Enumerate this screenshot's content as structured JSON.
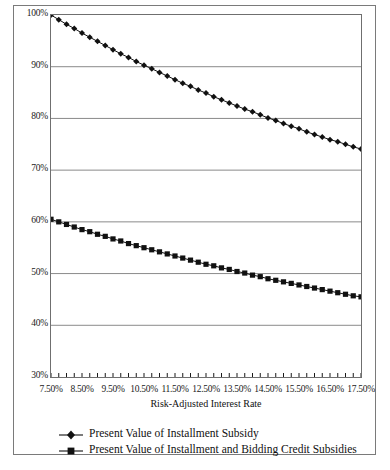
{
  "chart_data": {
    "type": "line",
    "title": "",
    "xlabel": "Risk-Adjusted Interest Rate",
    "ylabel": "",
    "xlim": [
      7.5,
      17.5
    ],
    "ylim": [
      30,
      100
    ],
    "grid": true,
    "grid_axis": "y",
    "legend_position": "bottom-left",
    "x_tick_labels": [
      "7.50%",
      "8.50%",
      "9.50%",
      "10.50%",
      "11.50%",
      "12.50%",
      "13.50%",
      "14.50%",
      "15.50%",
      "16.50%",
      "17.50%"
    ],
    "x_tick_values": [
      7.5,
      8.5,
      9.5,
      10.5,
      11.5,
      12.5,
      13.5,
      14.5,
      15.5,
      16.5,
      17.5
    ],
    "x_minor_tick_step": 0.25,
    "y_tick_labels": [
      "30%",
      "40%",
      "50%",
      "60%",
      "70%",
      "80%",
      "90%",
      "100%"
    ],
    "y_tick_values": [
      30,
      40,
      50,
      60,
      70,
      80,
      90,
      100
    ],
    "x": [
      7.5,
      7.75,
      8.0,
      8.25,
      8.5,
      8.75,
      9.0,
      9.25,
      9.5,
      9.75,
      10.0,
      10.25,
      10.5,
      10.75,
      11.0,
      11.25,
      11.5,
      11.75,
      12.0,
      12.25,
      12.5,
      12.75,
      13.0,
      13.25,
      13.5,
      13.75,
      14.0,
      14.25,
      14.5,
      14.75,
      15.0,
      15.25,
      15.5,
      15.75,
      16.0,
      16.25,
      16.5,
      16.75,
      17.0,
      17.25,
      17.5
    ],
    "series": [
      {
        "name": "Present Value of Installment Subsidy",
        "marker": "diamond",
        "color": "#111111",
        "values": [
          100.0,
          99.1,
          98.2,
          97.4,
          96.5,
          95.7,
          94.9,
          94.1,
          93.3,
          92.5,
          91.8,
          91.0,
          90.3,
          89.6,
          88.9,
          88.2,
          87.5,
          86.8,
          86.2,
          85.5,
          84.9,
          84.2,
          83.6,
          83.0,
          82.4,
          81.8,
          81.3,
          80.7,
          80.1,
          79.6,
          79.0,
          78.5,
          78.0,
          77.4,
          76.9,
          76.4,
          75.9,
          75.5,
          75.0,
          74.5,
          74.1
        ]
      },
      {
        "name": "Present Value of Installment and Bidding Credit Subsidies",
        "marker": "square",
        "color": "#111111",
        "values": [
          60.5,
          60.0,
          59.5,
          59.0,
          58.5,
          58.1,
          57.6,
          57.2,
          56.7,
          56.3,
          55.8,
          55.4,
          55.0,
          54.6,
          54.2,
          53.8,
          53.4,
          53.0,
          52.6,
          52.2,
          51.8,
          51.5,
          51.1,
          50.8,
          50.4,
          50.1,
          49.7,
          49.4,
          49.0,
          48.7,
          48.4,
          48.1,
          47.8,
          47.5,
          47.2,
          46.9,
          46.6,
          46.3,
          46.0,
          45.7,
          45.5
        ]
      }
    ]
  },
  "legend": {
    "items": [
      {
        "label": "Present Value of Installment Subsidy",
        "marker": "diamond"
      },
      {
        "label": "Present Value of Installment and Bidding Credit Subsidies",
        "marker": "square"
      }
    ]
  }
}
